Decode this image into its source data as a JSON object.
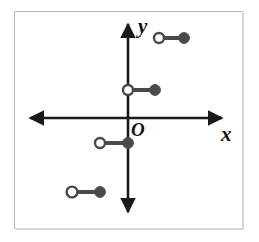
{
  "figure": {
    "background_color": "#ffffff",
    "frame_color": "#b9b9bd",
    "width": 259,
    "height": 242
  },
  "axes": {
    "origin_label": "O",
    "x_axis_label": "x",
    "y_axis_label": "y",
    "axis_color": "#1a1a1a",
    "origin_px": {
      "x": 128,
      "y": 118
    },
    "x_axis": {
      "start_px": 24,
      "end_px": 228,
      "y_px": 118,
      "arrows": "both"
    },
    "y_axis": {
      "start_px": 18,
      "end_px": 218,
      "x_px": 128,
      "arrows": "both"
    }
  },
  "chart_data": {
    "type": "line",
    "xlabel": "x",
    "ylabel": "y",
    "grid": false,
    "legend": null,
    "marker_styles": {
      "open": {
        "fill": "#ffffff",
        "stroke": "#4a4a4a",
        "meaning": "endpoint excluded"
      },
      "closed": {
        "fill": "#4a4a4a",
        "stroke": "#4a4a4a",
        "meaning": "endpoint included"
      }
    },
    "segment_color": "#4a4a4a",
    "segments": [
      {
        "id": "segment-1",
        "left_endpoint": {
          "type": "open",
          "px": {
            "x": 159,
            "y": 38
          }
        },
        "right_endpoint": {
          "type": "closed",
          "px": {
            "x": 184,
            "y": 38
          }
        }
      },
      {
        "id": "segment-2",
        "left_endpoint": {
          "type": "open",
          "px": {
            "x": 128,
            "y": 90
          }
        },
        "right_endpoint": {
          "type": "closed",
          "px": {
            "x": 155,
            "y": 90
          }
        }
      },
      {
        "id": "segment-3",
        "left_endpoint": {
          "type": "open",
          "px": {
            "x": 100,
            "y": 143
          }
        },
        "right_endpoint": {
          "type": "closed",
          "px": {
            "x": 128,
            "y": 143
          }
        }
      },
      {
        "id": "segment-4",
        "left_endpoint": {
          "type": "open",
          "px": {
            "x": 72,
            "y": 192
          }
        },
        "right_endpoint": {
          "type": "closed",
          "px": {
            "x": 100,
            "y": 192
          }
        }
      }
    ]
  }
}
